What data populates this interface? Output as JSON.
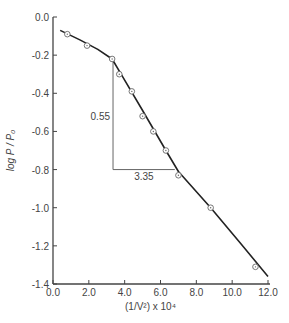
{
  "chart_data": {
    "type": "scatter",
    "title": "",
    "xlabel": "(1/V²) x 10⁴",
    "ylabel": "log P / P₀",
    "xlim": [
      0.0,
      12.0
    ],
    "ylim": [
      -1.4,
      0.0
    ],
    "grid": false,
    "legend": null,
    "x_ticks": [
      "0.0",
      "2.0",
      "4.0",
      "6.0",
      "8.0",
      "10.0",
      "12.0"
    ],
    "y_ticks": [
      "0.0",
      "-0.2",
      "-0.4",
      "-0.6",
      "-0.8",
      "-1.0",
      "-1.2",
      "-1.4"
    ],
    "series": [
      {
        "name": "data points",
        "marker": "circle-dot",
        "x": [
          0.8,
          1.9,
          3.3,
          3.7,
          4.4,
          5.0,
          5.6,
          6.3,
          7.0,
          8.8,
          11.3
        ],
        "y": [
          -0.09,
          -0.15,
          -0.22,
          -0.3,
          -0.39,
          -0.52,
          -0.6,
          -0.7,
          -0.83,
          -1.0,
          -1.31
        ]
      },
      {
        "name": "fitted curve",
        "type": "line",
        "x": [
          0.4,
          1.5,
          2.5,
          3.3,
          3.8,
          5.0,
          6.3,
          7.0,
          8.8,
          10.5,
          12.0
        ],
        "y": [
          -0.07,
          -0.12,
          -0.17,
          -0.22,
          -0.3,
          -0.49,
          -0.7,
          -0.81,
          -1.0,
          -1.19,
          -1.36
        ]
      }
    ],
    "annotations": [
      {
        "type": "slope-triangle",
        "x_start": 3.35,
        "x_end": 6.8,
        "y_top": -0.22,
        "y_bottom": -0.8,
        "vertical_label": "0.55",
        "horizontal_label": "3.35"
      }
    ]
  }
}
